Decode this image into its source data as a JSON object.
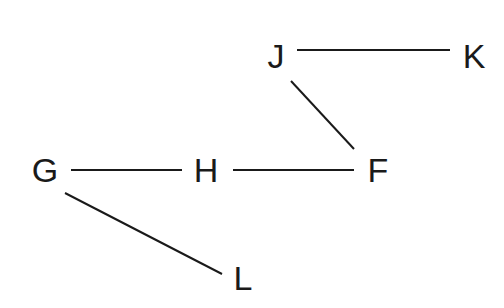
{
  "diagram": {
    "nodes": [
      {
        "id": "J",
        "label": "J",
        "x": 276,
        "y": 56
      },
      {
        "id": "K",
        "label": "K",
        "x": 474,
        "y": 56
      },
      {
        "id": "G",
        "label": "G",
        "x": 45,
        "y": 170
      },
      {
        "id": "H",
        "label": "H",
        "x": 206,
        "y": 170
      },
      {
        "id": "F",
        "label": "F",
        "x": 378,
        "y": 170
      },
      {
        "id": "L",
        "label": "L",
        "x": 243,
        "y": 278
      }
    ],
    "edges": [
      {
        "from": "J",
        "to": "K"
      },
      {
        "from": "J",
        "to": "F"
      },
      {
        "from": "G",
        "to": "H"
      },
      {
        "from": "H",
        "to": "F"
      },
      {
        "from": "G",
        "to": "L"
      }
    ],
    "line_color": "#1a1a1a"
  }
}
